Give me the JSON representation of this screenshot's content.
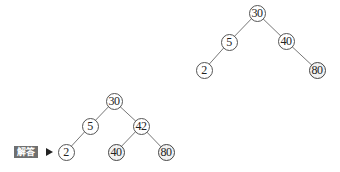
{
  "diagram": {
    "type": "binary-search-tree",
    "trees": [
      {
        "name": "original-tree",
        "nodes": [
          {
            "id": "t1-30",
            "value": "30",
            "x": 257,
            "y": 13
          },
          {
            "id": "t1-5",
            "value": "5",
            "x": 229,
            "y": 42
          },
          {
            "id": "t1-40",
            "value": "40",
            "x": 286,
            "y": 41
          },
          {
            "id": "t1-2",
            "value": "2",
            "x": 204,
            "y": 70
          },
          {
            "id": "t1-80",
            "value": "80",
            "x": 317,
            "y": 70
          }
        ],
        "edges": [
          [
            "t1-30",
            "t1-5"
          ],
          [
            "t1-30",
            "t1-40"
          ],
          [
            "t1-5",
            "t1-2"
          ],
          [
            "t1-40",
            "t1-80"
          ]
        ]
      },
      {
        "name": "answer-tree",
        "nodes": [
          {
            "id": "t2-30",
            "value": "30",
            "x": 114,
            "y": 101
          },
          {
            "id": "t2-5",
            "value": "5",
            "x": 90,
            "y": 126
          },
          {
            "id": "t2-42",
            "value": "42",
            "x": 141,
            "y": 126
          },
          {
            "id": "t2-2",
            "value": "2",
            "x": 66,
            "y": 152
          },
          {
            "id": "t2-40",
            "value": "40",
            "x": 116,
            "y": 152
          },
          {
            "id": "t2-80",
            "value": "80",
            "x": 166,
            "y": 152
          }
        ],
        "edges": [
          [
            "t2-30",
            "t2-5"
          ],
          [
            "t2-30",
            "t2-42"
          ],
          [
            "t2-5",
            "t2-2"
          ],
          [
            "t2-42",
            "t2-40"
          ],
          [
            "t2-42",
            "t2-80"
          ]
        ]
      }
    ],
    "answer_label": "解答",
    "colors": {
      "edge": "#777777",
      "node_border": "#555555",
      "label_bg": "#6f6f6f",
      "label_text": "#ffffff"
    }
  }
}
